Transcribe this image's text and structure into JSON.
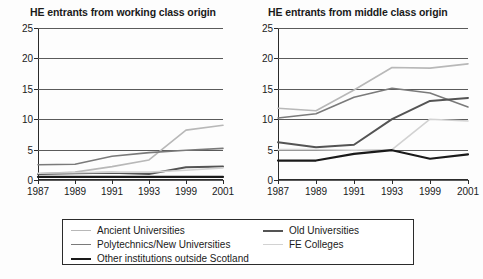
{
  "charts": [
    {
      "title": "HE entrants from working class origin",
      "panel": "left"
    },
    {
      "title": "HE entrants from middle class origin",
      "panel": "right"
    }
  ],
  "legend": {
    "column_1": [
      {
        "label": "Ancient Universities",
        "color": "#b8b8b8",
        "width": 1.6
      },
      {
        "label": "Polytechnics/New Universities",
        "color": "#7a7a7a",
        "width": 1.6
      },
      {
        "label": "Other institutions outside Scotland",
        "color": "#1a1a1a",
        "width": 2.2
      }
    ],
    "column_2": [
      {
        "label": "Old Universities",
        "color": "#545454",
        "width": 2.0
      },
      {
        "label": "FE Colleges",
        "color": "#d2d2d2",
        "width": 1.6
      }
    ]
  },
  "chart_data": [
    {
      "type": "line",
      "title": "HE entrants from working class origin",
      "xlabel": "",
      "ylabel": "",
      "x": [
        "1987",
        "1989",
        "1991",
        "1993",
        "1999",
        "2001"
      ],
      "ylim": [
        0,
        25
      ],
      "yticks": [
        0,
        5,
        10,
        15,
        20,
        25
      ],
      "grid": true,
      "legend_position": "bottom",
      "series": [
        {
          "name": "Ancient Universities",
          "color": "#b8b8b8",
          "width": 1.6,
          "values": [
            1.0,
            1.3,
            2.2,
            3.3,
            8.2,
            9.0
          ]
        },
        {
          "name": "Polytechnics/New Universities",
          "color": "#7a7a7a",
          "width": 1.6,
          "values": [
            2.5,
            2.6,
            3.9,
            4.5,
            4.9,
            5.2
          ]
        },
        {
          "name": "Old Universities",
          "color": "#545454",
          "width": 2.0,
          "values": [
            1.0,
            1.1,
            1.2,
            1.0,
            2.1,
            2.2
          ]
        },
        {
          "name": "FE Colleges",
          "color": "#d2d2d2",
          "width": 1.6,
          "values": [
            1.1,
            1.2,
            1.3,
            1.3,
            1.6,
            2.0
          ]
        },
        {
          "name": "Other institutions outside Scotland",
          "color": "#1a1a1a",
          "width": 2.2,
          "values": [
            0.5,
            0.5,
            0.5,
            0.5,
            0.5,
            0.5
          ]
        }
      ]
    },
    {
      "type": "line",
      "title": "HE entrants from middle class origin",
      "xlabel": "",
      "ylabel": "",
      "x": [
        "1987",
        "1989",
        "1991",
        "1993",
        "1999",
        "2001"
      ],
      "ylim": [
        0,
        25
      ],
      "yticks": [
        0,
        5,
        10,
        15,
        20,
        25
      ],
      "grid": true,
      "legend_position": "bottom",
      "series": [
        {
          "name": "Ancient Universities",
          "color": "#b8b8b8",
          "width": 1.6,
          "values": [
            11.8,
            11.4,
            14.8,
            18.5,
            18.4,
            19.1
          ]
        },
        {
          "name": "Polytechnics/New Universities",
          "color": "#7a7a7a",
          "width": 1.6,
          "values": [
            10.2,
            10.9,
            13.6,
            15.1,
            14.3,
            12.0
          ]
        },
        {
          "name": "Old Universities",
          "color": "#545454",
          "width": 2.0,
          "values": [
            6.2,
            5.4,
            5.8,
            10.0,
            13.0,
            13.5
          ]
        },
        {
          "name": "FE Colleges",
          "color": "#d2d2d2",
          "width": 1.6,
          "values": [
            5.0,
            5.0,
            4.9,
            5.0,
            10.0,
            9.7
          ]
        },
        {
          "name": "Other institutions outside Scotland",
          "color": "#1a1a1a",
          "width": 2.2,
          "values": [
            3.2,
            3.2,
            4.3,
            4.9,
            3.5,
            4.2
          ]
        }
      ]
    }
  ]
}
